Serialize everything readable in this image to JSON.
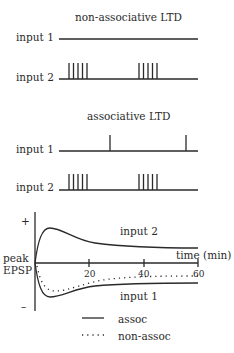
{
  "panels": [
    {
      "title": "non-associative LTD",
      "rows": [
        {
          "label": "input 1",
          "spikes": "none"
        },
        {
          "label": "input 2",
          "spikes": "two bursts of 5"
        }
      ]
    },
    {
      "title": "associative LTD",
      "rows": [
        {
          "label": "input 1",
          "spikes": "single spikes at second burst and end"
        },
        {
          "label": "input 2",
          "spikes": "two bursts of 5"
        }
      ]
    }
  ],
  "graph": {
    "y_plus": "+",
    "y_minus": "–",
    "ylabel_line1": "peak",
    "ylabel_line2": "EPSP",
    "xlabel": "time (min)",
    "ticks": [
      "20",
      "40",
      "60"
    ],
    "curve_top_label": "input 2",
    "curve_bottom_label": "input 1"
  },
  "legend": {
    "solid": "assoc",
    "dotted": "non-assoc"
  },
  "colors": {
    "ink": "#2a2a2a",
    "background": "#ffffff"
  }
}
